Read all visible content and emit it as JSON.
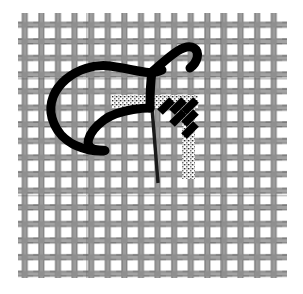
{
  "figure": {
    "image_width": 303,
    "image_height": 294,
    "background_color": "#ffffff"
  },
  "canvas_cloth": {
    "name": "woven canvas mesh",
    "x": 18,
    "y": 13,
    "width": 269,
    "height": 265,
    "thread_color": "#9a9a9a",
    "thread_color_dark": "#6e6e6e",
    "gap_color": "#ffffff",
    "cell_pitch": 16.6,
    "warp_count": 17,
    "weft_count": 17,
    "thread_width": 5.5
  },
  "embroidery_thread": {
    "name": "working thread loop",
    "color": "#000000",
    "stroke_width": 9,
    "loop_left_x": 52,
    "loop_top_y": 63,
    "loop_bottom_y": 150,
    "tail_end_x": 197,
    "tail_end_y": 40
  },
  "needle": {
    "name": "sewing needle",
    "color": "#1a1a1a",
    "stroke_width": 3.4,
    "top_x": 152,
    "top_y": 108,
    "bottom_x": 158,
    "bottom_y": 183
  },
  "worked_stitches": {
    "name": "completed slanted stitches",
    "color": "#000000",
    "count": 6,
    "slant": "diagonal top-right to bottom-left",
    "stitch_length": 19,
    "stitch_width": 8,
    "origin_x": 160,
    "origin_y": 104,
    "step_x": 11,
    "step_y": 11
  },
  "highlight_bands": {
    "name": "exposed canvas highlight",
    "color": "#ffffff",
    "speckle_color": "#2b2b2b",
    "horizontal": {
      "x": 112,
      "y": 95,
      "width": 86,
      "height": 13
    },
    "vertical": {
      "x": 182,
      "y": 95,
      "width": 13,
      "height": 84
    }
  }
}
